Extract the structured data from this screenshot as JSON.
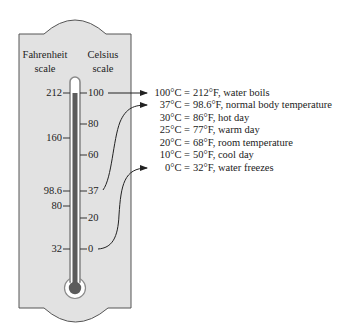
{
  "diagram": {
    "headers": {
      "fahrenheit": [
        "Fahrenheit",
        "scale"
      ],
      "celsius": [
        "Celsius",
        "scale"
      ]
    },
    "fahrenheit_ticks": [
      {
        "label": "212",
        "y": 93
      },
      {
        "label": "160",
        "y": 138
      },
      {
        "label": "98.6",
        "y": 191
      },
      {
        "label": "80",
        "y": 206
      },
      {
        "label": "32",
        "y": 249
      }
    ],
    "celsius_ticks": [
      {
        "label": "100",
        "y": 93
      },
      {
        "label": "80",
        "y": 124
      },
      {
        "label": "60",
        "y": 155
      },
      {
        "label": "37",
        "y": 191
      },
      {
        "label": "20",
        "y": 218
      },
      {
        "label": "0",
        "y": 249
      }
    ],
    "reference_points": [
      {
        "celsius": "100°C =",
        "fahrenheit": "212°F, water boils",
        "arrow": true
      },
      {
        "celsius": "37°C =",
        "fahrenheit": "98.6°F, normal body temperature",
        "arrow": true
      },
      {
        "celsius": "30°C =",
        "fahrenheit": "86°F, hot day",
        "arrow": false
      },
      {
        "celsius": "25°C =",
        "fahrenheit": "77°F, warm day",
        "arrow": false
      },
      {
        "celsius": "20°C =",
        "fahrenheit": "68°F, room temperature",
        "arrow": false
      },
      {
        "celsius": "10°C =",
        "fahrenheit": "50°F, cool day",
        "arrow": false
      },
      {
        "celsius": "0°C =",
        "fahrenheit": "32°F, water freezes",
        "arrow": true
      }
    ],
    "colors": {
      "panel_fill": "#e2e2e2",
      "panel_stroke": "#555555",
      "tube_wall": "#8a8a8a",
      "tube_interior": "#ffffff",
      "mercury": "#5c5c5c",
      "ink": "#222222"
    }
  }
}
